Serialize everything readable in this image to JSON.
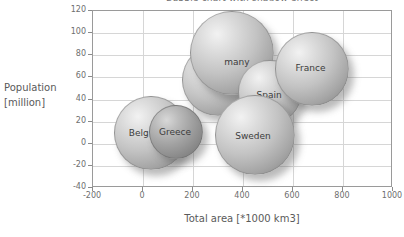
{
  "chart_data": {
    "type": "scatter",
    "subtype": "bubble",
    "title": "Bubble chart with shadow effect",
    "xlabel": "Total area [*1000 km3]",
    "ylabel": "Population [million]",
    "ylabel_lines": [
      "Population",
      "[million]"
    ],
    "xlim": [
      -200,
      1000
    ],
    "ylim": [
      -40,
      120
    ],
    "xticks": [
      "-200",
      "0",
      "200",
      "400",
      "600",
      "800",
      "1000"
    ],
    "yticks": [
      "120",
      "100",
      "80",
      "60",
      "40",
      "20",
      "0",
      "-20",
      "-40"
    ],
    "grid": true,
    "legend": "none",
    "background_color": "#ffffff",
    "gridline_color": "#d6d6d6",
    "axis_color": "#9a9a9a",
    "bubble_fill_color": "#c3c3c3",
    "bubble_dark_fill_color": "#a2a2a2",
    "label_color": "#3c3c3c",
    "points": [
      {
        "name": "Belgium",
        "label": "Belg",
        "label_full": "Belgium",
        "x": 31,
        "y": 10,
        "size": 74,
        "shade": "light",
        "label_dx": -22,
        "label_dy": 1
      },
      {
        "name": "Greece",
        "label": "Greece",
        "label_full": "Greece",
        "x": 132,
        "y": 11,
        "size": 54,
        "shade": "dark",
        "label_dx": -17,
        "label_dy": 1
      },
      {
        "name": "Italy",
        "label": "Italy",
        "label_full": "Italy",
        "x": 301,
        "y": 58,
        "size": 72,
        "shade": "light",
        "label_dx": -11,
        "label_dy": 2
      },
      {
        "name": "Germany",
        "label": "many",
        "label_full": "Germany",
        "x": 357,
        "y": 82,
        "size": 84,
        "shade": "light",
        "label_dx": -8,
        "label_dy": 10
      },
      {
        "name": "Spain",
        "label": "Spain",
        "label_full": "Spain",
        "x": 506,
        "y": 47,
        "size": 64,
        "shade": "light",
        "label_dx": -13,
        "label_dy": 4
      },
      {
        "name": "France",
        "label": "France",
        "label_full": "France",
        "x": 674,
        "y": 68,
        "size": 74,
        "shade": "light",
        "label_dx": -16,
        "label_dy": 0
      },
      {
        "name": "Sweden",
        "label": "Sweden",
        "label_full": "Sweden",
        "x": 449,
        "y": 8,
        "size": 80,
        "shade": "light",
        "label_dx": -20,
        "label_dy": 2
      }
    ]
  }
}
